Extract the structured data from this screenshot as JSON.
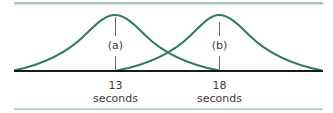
{
  "diagram": {
    "curves": [
      {
        "id": "a",
        "label": "(a)",
        "peak_x_label": "13",
        "unit": "seconds"
      },
      {
        "id": "b",
        "label": "(b)",
        "peak_x_label": "18",
        "unit": "seconds"
      }
    ],
    "colors": {
      "curve": "#2e7d62",
      "rule": "#a9c9bd",
      "axis": "#1a1a1a",
      "marker": "#666666"
    }
  }
}
